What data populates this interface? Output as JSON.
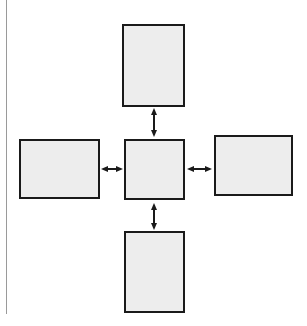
{
  "figure": {
    "type": "block-diagram",
    "title": "",
    "caption": "",
    "canvas": {
      "width": 307,
      "height": 326
    },
    "background_color": "#ffffff",
    "box_fill_color": "#ededed",
    "box_border_color": "#1a1a1a",
    "arrow_color": "#1a1a1a",
    "page_edge_rule_color": "#9a9a9a",
    "node_count": 5,
    "arrow_count": 4,
    "arrow_style": "double-headed",
    "layout": "cross"
  },
  "nodes": [
    {
      "id": "top",
      "name": "top-box",
      "label": "",
      "x": 122,
      "y": 24,
      "width": 63,
      "height": 83,
      "orientation": "portrait"
    },
    {
      "id": "left",
      "name": "left-box",
      "label": "",
      "x": 19,
      "y": 139,
      "width": 81,
      "height": 60,
      "orientation": "landscape"
    },
    {
      "id": "center",
      "name": "center-box",
      "label": "",
      "x": 124,
      "y": 139,
      "width": 61,
      "height": 61,
      "orientation": "square"
    },
    {
      "id": "right",
      "name": "right-box",
      "label": "",
      "x": 214,
      "y": 135,
      "width": 79,
      "height": 61,
      "orientation": "landscape"
    },
    {
      "id": "bottom",
      "name": "bottom-box",
      "label": "",
      "x": 124,
      "y": 231,
      "width": 61,
      "height": 82,
      "orientation": "portrait"
    }
  ],
  "connectors": [
    {
      "id": "top-center",
      "name": "arrow-top-center",
      "from": "center",
      "to": "top",
      "label": "",
      "direction": "vertical",
      "heads": "both",
      "x": 154,
      "y1": 108,
      "y2": 137
    },
    {
      "id": "left-center",
      "name": "arrow-left-center",
      "from": "left",
      "to": "center",
      "label": "",
      "direction": "horizontal",
      "heads": "both",
      "y": 169,
      "x1": 101,
      "x2": 123
    },
    {
      "id": "center-right",
      "name": "arrow-center-right",
      "from": "center",
      "to": "right",
      "label": "",
      "direction": "horizontal",
      "heads": "both",
      "y": 169,
      "x1": 187,
      "x2": 212
    },
    {
      "id": "center-bottom",
      "name": "arrow-center-bottom",
      "from": "center",
      "to": "bottom",
      "label": "",
      "direction": "vertical",
      "heads": "both",
      "x": 154,
      "y1": 203,
      "y2": 230
    }
  ]
}
